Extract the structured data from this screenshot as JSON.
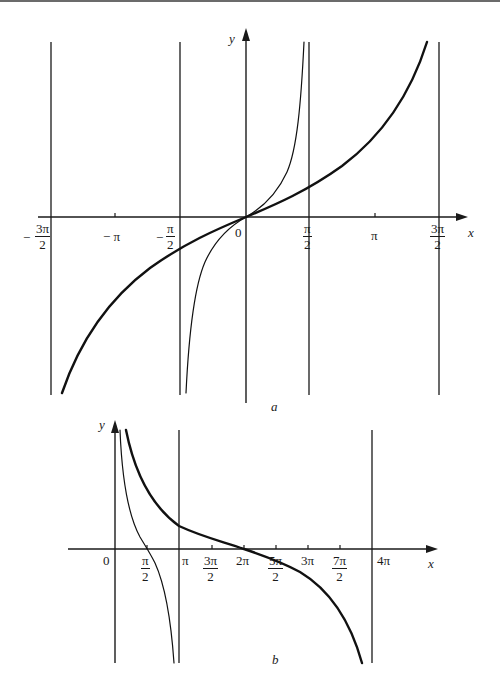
{
  "figure": {
    "panel_a": {
      "caption": "a",
      "x_axis_label": "x",
      "y_axis_label": "y",
      "origin_label": "0",
      "ticks": {
        "neg_three_pi_over_2": {
          "sign": "−",
          "num": "3π",
          "den": "2"
        },
        "neg_pi": "− π",
        "neg_pi_over_2": {
          "sign": "−",
          "num": "π",
          "den": "2"
        },
        "pi_over_2": {
          "num": "π",
          "den": "2"
        },
        "pi": "π",
        "three_pi_over_2": {
          "num": "3π",
          "den": "2"
        }
      },
      "asymptotes": [
        "-3π/2",
        "-π/2",
        "π/2",
        "3π/2"
      ],
      "curves": [
        {
          "name": "thick",
          "description": "slowly increasing tangent-like curve through origin, asymptotes at ±3π/2"
        },
        {
          "name": "thin",
          "description": "tan x branch through origin, asymptotes at ±π/2"
        }
      ]
    },
    "panel_b": {
      "caption": "b",
      "x_axis_label": "x",
      "y_axis_label": "y",
      "origin_label": "0",
      "ticks": {
        "pi_over_2": {
          "num": "π",
          "den": "2"
        },
        "pi": "π",
        "three_pi_over_2": {
          "num": "3π",
          "den": "2"
        },
        "two_pi": "2π",
        "five_pi_over_2": {
          "num": "5π",
          "den": "2"
        },
        "three_pi": "3π",
        "seven_pi_over_2": {
          "num": "7π",
          "den": "2"
        },
        "four_pi": "4π"
      },
      "asymptotes": [
        "0",
        "π",
        "4π"
      ],
      "curves": [
        {
          "name": "thick",
          "description": "decreasing cotangent-like curve between 0 and 4π, crossing at 2π"
        },
        {
          "name": "thin",
          "description": "cot x branch between 0 and π, crossing at π/2"
        }
      ]
    }
  }
}
